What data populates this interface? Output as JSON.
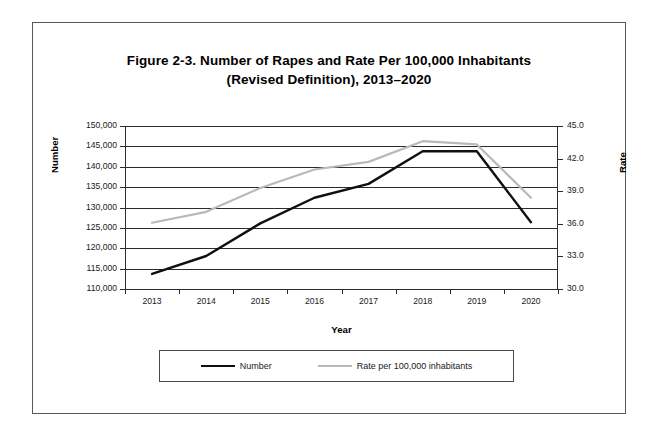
{
  "figure": {
    "title_line1": "Figure 2-3. Number of Rapes and Rate Per 100,000 Inhabitants",
    "title_line2": "(Revised Definition),  2013–2020"
  },
  "axes": {
    "x_title": "Year",
    "y_left_title": "Number",
    "y_right_title": "Rate"
  },
  "legend": {
    "entries": [
      {
        "label": "Number",
        "color": "#101010"
      },
      {
        "label": "Rate per 100,000 inhabitants",
        "color": "#b9b9b9"
      }
    ]
  },
  "chart_data": {
    "type": "line",
    "title": "Figure 2-3. Number of Rapes and Rate Per 100,000 Inhabitants (Revised Definition), 2013–2020",
    "xlabel": "Year",
    "ylabel": "Number",
    "y2label": "Rate",
    "grid": true,
    "legend_position": "bottom",
    "categories": [
      "2013",
      "2014",
      "2015",
      "2016",
      "2017",
      "2018",
      "2019",
      "2020"
    ],
    "x_tick_labels": [
      "2013",
      "2014",
      "2015",
      "2016",
      "2017",
      "2018",
      "2019",
      "2020"
    ],
    "y_tick_labels": [
      "110,000",
      "115,000",
      "120,000",
      "125,000",
      "130,000",
      "135,000",
      "140,000",
      "145,000",
      "150,000"
    ],
    "y2_tick_labels": [
      "30.0",
      "33.0",
      "36.0",
      "39.0",
      "42.0",
      "45.0"
    ],
    "ylim": [
      110000,
      150000
    ],
    "y2lim": [
      30.0,
      45.0
    ],
    "y_ticks": [
      110000,
      115000,
      120000,
      125000,
      130000,
      135000,
      140000,
      145000,
      150000
    ],
    "y2_ticks": [
      30.0,
      33.0,
      36.0,
      39.0,
      42.0,
      45.0
    ],
    "series": [
      {
        "name": "Number",
        "axis": "left",
        "color": "#101010",
        "values": [
          113700,
          118100,
          126100,
          132400,
          135800,
          143800,
          143800,
          126400
        ]
      },
      {
        "name": "Rate per 100,000 inhabitants",
        "axis": "right",
        "color": "#b9b9b9",
        "values": [
          36.1,
          37.1,
          39.3,
          41.0,
          41.7,
          43.6,
          43.3,
          38.4
        ]
      }
    ]
  }
}
